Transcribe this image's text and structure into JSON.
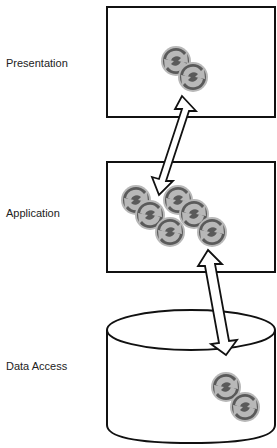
{
  "tiers": [
    {
      "label": "Presentation",
      "shape": "rectangle",
      "component_count": 2
    },
    {
      "label": "Application",
      "shape": "rectangle",
      "component_count": 6
    },
    {
      "label": "Data Access",
      "shape": "cylinder",
      "component_count": 2
    }
  ],
  "connectors": [
    {
      "from": "Presentation",
      "to": "Application",
      "style": "double-headed hollow arrow"
    },
    {
      "from": "Application",
      "to": "Data Access",
      "style": "double-headed hollow arrow"
    }
  ],
  "icons": {
    "component": "recycle-arrows-circle-icon"
  },
  "colors": {
    "icon_light": "#b8b8b8",
    "icon_dark": "#5a5a5a",
    "stroke": "#111111"
  }
}
